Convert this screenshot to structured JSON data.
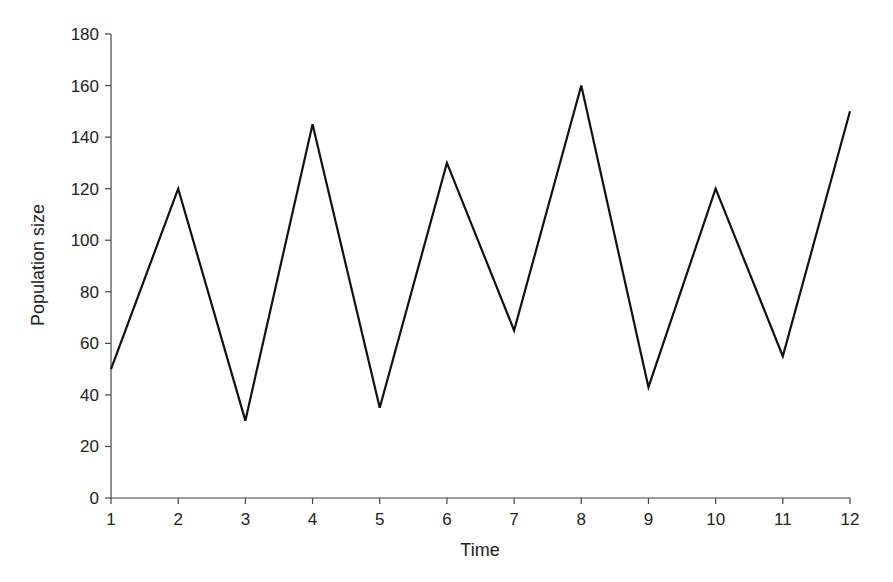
{
  "chart_data": {
    "type": "line",
    "title": "",
    "xlabel": "Time",
    "ylabel": "Population size",
    "x": [
      1,
      2,
      3,
      4,
      5,
      6,
      7,
      8,
      9,
      10,
      11,
      12
    ],
    "series": [
      {
        "name": "Population size",
        "values": [
          50,
          120,
          30,
          145,
          35,
          130,
          65,
          160,
          43,
          120,
          55,
          150
        ],
        "color": "#111111"
      }
    ],
    "xlim": [
      1,
      12
    ],
    "ylim": [
      0,
      180
    ],
    "xticks": [
      1,
      2,
      3,
      4,
      5,
      6,
      7,
      8,
      9,
      10,
      11,
      12
    ],
    "yticks": [
      0,
      20,
      40,
      60,
      80,
      100,
      120,
      140,
      160,
      180
    ],
    "grid": false,
    "legend": null
  }
}
